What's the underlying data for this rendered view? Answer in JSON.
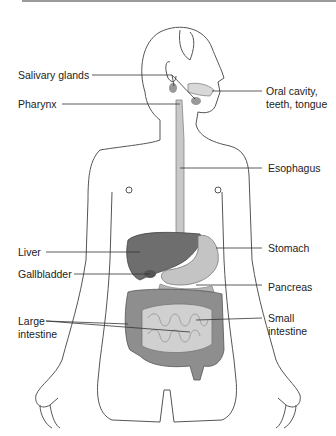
{
  "diagram": {
    "labels": {
      "salivary_glands": "Salivary glands",
      "pharynx": "Pharynx",
      "oral_cavity_line1": "Oral cavity,",
      "oral_cavity_line2": "teeth, tongue",
      "esophagus": "Esophagus",
      "liver": "Liver",
      "stomach": "Stomach",
      "gallbladder": "Gallbladder",
      "pancreas": "Pancreas",
      "large_intestine_line1": "Large",
      "large_intestine_line2": "intestine",
      "small_intestine_line1": "Small",
      "small_intestine_line2": "intestine"
    },
    "colors": {
      "outline": "#555555",
      "organ_dark": "#6e6e6e",
      "organ_mid": "#9a9a9a",
      "organ_light": "#c8c8c8",
      "leader_line": "#333333"
    }
  }
}
